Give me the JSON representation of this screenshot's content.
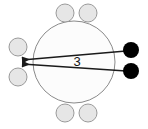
{
  "diagram": {
    "type": "node-link-diagram",
    "canvas": {
      "width": 148,
      "height": 129,
      "background": "#ffffff"
    },
    "colors": {
      "hub_fill": "#fcfcfc",
      "hub_stroke": "#8a8a8a",
      "gray_node_fill": "#e6e6e6",
      "gray_node_stroke": "#9a9a9a",
      "black_node_fill": "#000000",
      "edge_stroke": "#1a1a1a",
      "label_color": "#141414"
    },
    "hub": {
      "name": "central-circle",
      "cx": 74,
      "cy": 62,
      "r": 41,
      "stroke_width": 1
    },
    "gray_nodes": [
      {
        "name": "gray-node-top-left",
        "cx": 65,
        "cy": 13,
        "r": 9
      },
      {
        "name": "gray-node-top-right",
        "cx": 88,
        "cy": 13,
        "r": 9
      },
      {
        "name": "gray-node-left-upper",
        "cx": 18,
        "cy": 47,
        "r": 9
      },
      {
        "name": "gray-node-left-lower",
        "cx": 18,
        "cy": 77,
        "r": 9
      },
      {
        "name": "gray-node-bottom-left",
        "cx": 65,
        "cy": 113,
        "r": 9
      },
      {
        "name": "gray-node-bottom-right",
        "cx": 88,
        "cy": 113,
        "r": 9
      }
    ],
    "black_nodes": [
      {
        "name": "black-node-upper",
        "cx": 131,
        "cy": 50,
        "r": 8
      },
      {
        "name": "black-node-lower",
        "cx": 131,
        "cy": 71,
        "r": 8
      }
    ],
    "edges": [
      {
        "name": "edge-upper",
        "from": "black-node-upper",
        "to": "gray-node-left-upper",
        "x1": 126,
        "y1": 51,
        "x2": 22,
        "y2": 60,
        "arrowhead": "left",
        "stroke_width": 1.4
      },
      {
        "name": "edge-lower",
        "from": "black-node-lower",
        "to": "gray-node-left-lower",
        "x1": 126,
        "y1": 71,
        "x2": 22,
        "y2": 64,
        "arrowhead": "left",
        "stroke_width": 1.4
      }
    ],
    "labels": [
      {
        "name": "edge-weight-label",
        "text": "3",
        "x": 77,
        "y": 63
      }
    ]
  }
}
